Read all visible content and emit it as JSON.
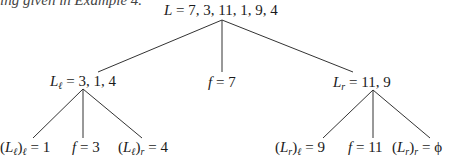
{
  "header": {
    "clipped_text": "ing given in Example 4."
  },
  "tree": {
    "root": {
      "var": "L",
      "sub": "",
      "rhs": "7, 3, 11, 1, 9, 4"
    },
    "level1": [
      {
        "var": "L",
        "sub": "ℓ",
        "rhs": "3, 1, 4"
      },
      {
        "var": "f",
        "sub": "",
        "rhs": "7"
      },
      {
        "var": "L",
        "sub": "r",
        "rhs": "11, 9"
      }
    ],
    "level2_left": [
      {
        "prefix": "(L",
        "inner_sub": "ℓ",
        "outer_sub": "ℓ",
        "rhs": "1"
      },
      {
        "var": "f",
        "rhs": "3"
      },
      {
        "prefix": "(L",
        "inner_sub": "ℓ",
        "outer_sub": "r",
        "rhs": "4"
      }
    ],
    "level2_right": [
      {
        "prefix": "(L",
        "inner_sub": "r",
        "outer_sub": "ℓ",
        "rhs": "9"
      },
      {
        "var": "f",
        "rhs": "11"
      },
      {
        "prefix": "(L",
        "inner_sub": "r",
        "outer_sub": "r",
        "rhs": "ϕ"
      }
    ],
    "equals": "=",
    "edge_color": "#333333"
  }
}
